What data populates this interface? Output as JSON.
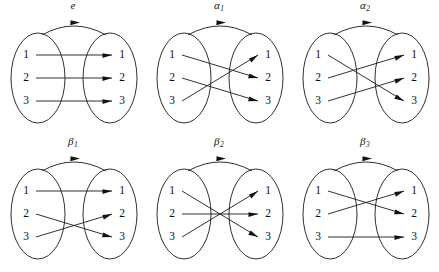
{
  "figure": {
    "domain_elements": [
      "1",
      "2",
      "3"
    ],
    "codomain_elements": [
      "1",
      "2",
      "3"
    ],
    "ink_color": "#1a1a1a",
    "background_color": "#ffffff"
  },
  "panels": [
    {
      "id": "e",
      "label_base": "e",
      "label_sub": "",
      "left_labels": [
        "1",
        "2",
        "3"
      ],
      "right_labels": [
        "1",
        "2",
        "3"
      ],
      "mapping": [
        {
          "from": 1,
          "to": 1
        },
        {
          "from": 2,
          "to": 2
        },
        {
          "from": 3,
          "to": 3
        }
      ]
    },
    {
      "id": "alpha1",
      "label_base": "α",
      "label_sub": "1",
      "left_labels": [
        "1",
        "2",
        "3"
      ],
      "right_labels": [
        "1",
        "2",
        "3"
      ],
      "mapping": [
        {
          "from": 1,
          "to": 2
        },
        {
          "from": 2,
          "to": 3
        },
        {
          "from": 3,
          "to": 1
        }
      ]
    },
    {
      "id": "alpha2",
      "label_base": "α",
      "label_sub": "2",
      "left_labels": [
        "1",
        "2",
        "3"
      ],
      "right_labels": [
        "1",
        "2",
        "3"
      ],
      "mapping": [
        {
          "from": 1,
          "to": 3
        },
        {
          "from": 2,
          "to": 1
        },
        {
          "from": 3,
          "to": 2
        }
      ]
    },
    {
      "id": "beta1",
      "label_base": "β",
      "label_sub": "1",
      "left_labels": [
        "1",
        "2",
        "3"
      ],
      "right_labels": [
        "1",
        "2",
        "3"
      ],
      "mapping": [
        {
          "from": 1,
          "to": 1
        },
        {
          "from": 2,
          "to": 3
        },
        {
          "from": 3,
          "to": 2
        }
      ]
    },
    {
      "id": "beta2",
      "label_base": "β",
      "label_sub": "2",
      "left_labels": [
        "1",
        "2",
        "3"
      ],
      "right_labels": [
        "1",
        "2",
        "3"
      ],
      "mapping": [
        {
          "from": 1,
          "to": 3
        },
        {
          "from": 2,
          "to": 2
        },
        {
          "from": 3,
          "to": 1
        }
      ]
    },
    {
      "id": "beta3",
      "label_base": "β",
      "label_sub": "3",
      "left_labels": [
        "1",
        "2",
        "3"
      ],
      "right_labels": [
        "1",
        "2",
        "3"
      ],
      "mapping": [
        {
          "from": 1,
          "to": 2
        },
        {
          "from": 2,
          "to": 1
        },
        {
          "from": 3,
          "to": 3
        }
      ]
    }
  ]
}
